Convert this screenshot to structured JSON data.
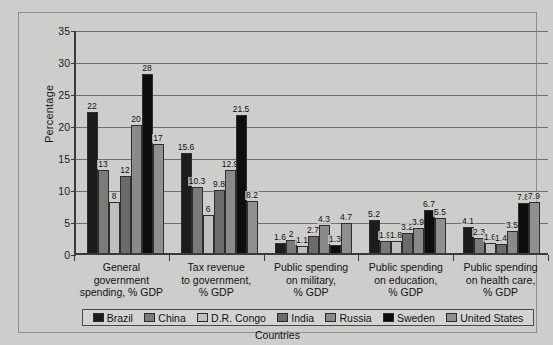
{
  "chart_data": {
    "type": "bar",
    "title": "",
    "xlabel": "Countries",
    "ylabel": "Percentage",
    "ylim": [
      0,
      35
    ],
    "yticks": [
      0,
      5,
      10,
      15,
      20,
      25,
      30,
      35
    ],
    "ytick_labels": [
      "0",
      "5",
      "10",
      "15",
      "20",
      "25",
      "30",
      "35"
    ],
    "grid": true,
    "legend_position": "bottom",
    "categories": [
      "General government spending, % GDP",
      "Tax revenue to government, % GDP",
      "Public spending on military, % GDP",
      "Public spending on education, % GDP",
      "Public spending on health care, % GDP"
    ],
    "category_lines": [
      [
        "General",
        "government",
        "spending, % GDP"
      ],
      [
        "Tax revenue",
        "to government,",
        "% GDP"
      ],
      [
        "Public spending",
        "on military,",
        "% GDP"
      ],
      [
        "Public spending",
        "on education,",
        "% GDP"
      ],
      [
        "Public spending",
        "on health care,",
        "% GDP"
      ]
    ],
    "series": [
      {
        "name": "Brazil",
        "color": "#1c1c1c",
        "values": [
          22,
          15.6,
          1.6,
          5.2,
          4.1
        ],
        "labels": [
          "22",
          "15.6",
          "1.6",
          "5.2",
          "4.1"
        ]
      },
      {
        "name": "China",
        "color": "#7a7a78",
        "values": [
          13,
          10.3,
          2,
          1.9,
          2.3
        ],
        "labels": [
          "13",
          "10.3",
          "2",
          "1.9",
          "2.3"
        ]
      },
      {
        "name": "D.R. Congo",
        "color": "#bfbfbd",
        "values": [
          8,
          6,
          1.1,
          1.8,
          1.6
        ],
        "labels": [
          "8",
          "6",
          "1.1",
          "1.8",
          "1.6"
        ]
      },
      {
        "name": "India",
        "color": "#6b6b69",
        "values": [
          12,
          9.8,
          2.7,
          3.2,
          1.4
        ],
        "labels": [
          "12",
          "9.8",
          "2.7",
          "3.2",
          "1.4"
        ]
      },
      {
        "name": "Russia",
        "color": "#8a8a88",
        "values": [
          20,
          12.9,
          4.3,
          3.9,
          3.5
        ],
        "labels": [
          "20",
          "12.9",
          "4.3",
          "3.9",
          "3.5"
        ]
      },
      {
        "name": "Sweden",
        "color": "#0e0e0e",
        "values": [
          28,
          21.5,
          1.3,
          6.7,
          7.8
        ],
        "labels": [
          "28",
          "21.5",
          "1.3",
          "6.7",
          "7.8"
        ]
      },
      {
        "name": "United States",
        "color": "#8f8f8d",
        "values": [
          17,
          8.2,
          4.7,
          5.5,
          7.9
        ],
        "labels": [
          "17",
          "8.2",
          "4.7",
          "5.5",
          "7.9"
        ]
      }
    ]
  },
  "legend": {
    "items": [
      {
        "label": "Brazil",
        "color": "#1c1c1c"
      },
      {
        "label": "China",
        "color": "#7a7a78"
      },
      {
        "label": "D.R. Congo",
        "color": "#bfbfbd"
      },
      {
        "label": "India",
        "color": "#6b6b69"
      },
      {
        "label": "Russia",
        "color": "#8a8a88"
      },
      {
        "label": "Sweden",
        "color": "#0e0e0e"
      },
      {
        "label": "United States",
        "color": "#8f8f8d"
      }
    ]
  },
  "axis": {
    "y_title": "Percentage",
    "x_title": "Countries"
  },
  "colors": {
    "background": "#cdcdcb",
    "frame": "#8d8d8b",
    "axis": "#3a3a3a",
    "gridline": "#6f6f6f",
    "text": "#131313"
  }
}
